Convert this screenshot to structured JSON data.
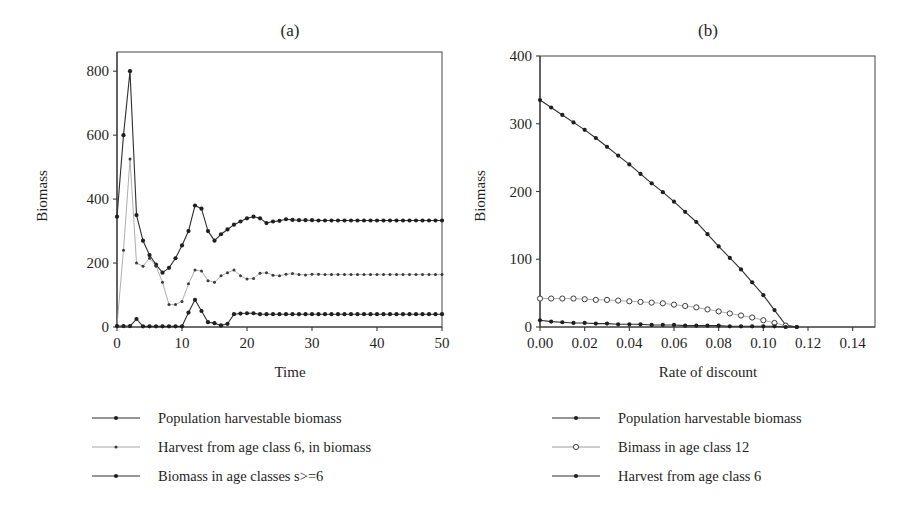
{
  "figure": {
    "panel_a_title": "(a)",
    "panel_b_title": "(b)"
  },
  "chart_data": [
    {
      "type": "line",
      "title": "(a)",
      "xlabel": "Time",
      "ylabel": "Biomass",
      "xlim": [
        0,
        50
      ],
      "ylim": [
        0,
        860
      ],
      "xticks": [
        0,
        10,
        20,
        30,
        40,
        50
      ],
      "xticklabels": [
        "0",
        "10",
        "20",
        "30",
        "40",
        "50"
      ],
      "yticks": [
        0,
        200,
        400,
        600,
        800
      ],
      "yticklabels": [
        "0",
        "200",
        "400",
        "600",
        "800"
      ],
      "grid": false,
      "legend_position": "below",
      "series": [
        {
          "name": "Population harvestable biomass",
          "marker": "filled-circle",
          "color": "#2a2a2a",
          "x": [
            0,
            1,
            2,
            3,
            4,
            5,
            6,
            7,
            8,
            9,
            10,
            11,
            12,
            13,
            14,
            15,
            16,
            17,
            18,
            19,
            20,
            21,
            22,
            23,
            24,
            25,
            26,
            27,
            28,
            29,
            30,
            31,
            32,
            33,
            34,
            35,
            36,
            37,
            38,
            39,
            40,
            41,
            42,
            43,
            44,
            45,
            46,
            47,
            48,
            49,
            50
          ],
          "values": [
            345,
            600,
            800,
            350,
            270,
            225,
            195,
            170,
            185,
            215,
            255,
            300,
            380,
            370,
            300,
            270,
            290,
            305,
            320,
            330,
            340,
            345,
            340,
            325,
            330,
            332,
            337,
            335,
            334,
            334,
            334,
            333,
            333,
            333,
            333,
            333,
            333,
            333,
            333,
            333,
            333,
            333,
            333,
            333,
            333,
            333,
            333,
            333,
            333,
            333,
            333
          ]
        },
        {
          "name": "Harvest from age class 6, in biomass",
          "marker": "small-dot",
          "color": "#8a8a8a",
          "x": [
            0,
            1,
            2,
            3,
            4,
            5,
            6,
            7,
            8,
            9,
            10,
            11,
            12,
            13,
            14,
            15,
            16,
            17,
            18,
            19,
            20,
            21,
            22,
            23,
            24,
            25,
            26,
            27,
            28,
            29,
            30,
            31,
            32,
            33,
            34,
            35,
            36,
            37,
            38,
            39,
            40,
            41,
            42,
            43,
            44,
            45,
            46,
            47,
            48,
            49,
            50
          ],
          "values": [
            5,
            240,
            525,
            200,
            190,
            215,
            190,
            140,
            70,
            70,
            80,
            135,
            178,
            175,
            145,
            140,
            160,
            170,
            178,
            160,
            150,
            152,
            168,
            170,
            162,
            160,
            165,
            167,
            164,
            163,
            165,
            165,
            164,
            164,
            164,
            164,
            164,
            164,
            164,
            164,
            164,
            164,
            164,
            164,
            164,
            164,
            164,
            164,
            164,
            164,
            164
          ]
        },
        {
          "name": "Biomass in age classes s>=6",
          "marker": "filled-circle",
          "color": "#2a2a2a",
          "x": [
            0,
            1,
            2,
            3,
            4,
            5,
            6,
            7,
            8,
            9,
            10,
            11,
            12,
            13,
            14,
            15,
            16,
            17,
            18,
            19,
            20,
            21,
            22,
            23,
            24,
            25,
            26,
            27,
            28,
            29,
            30,
            31,
            32,
            33,
            34,
            35,
            36,
            37,
            38,
            39,
            40,
            41,
            42,
            43,
            44,
            45,
            46,
            47,
            48,
            49,
            50
          ],
          "values": [
            3,
            3,
            3,
            25,
            2,
            2,
            2,
            2,
            2,
            2,
            2,
            45,
            85,
            50,
            15,
            12,
            5,
            10,
            40,
            42,
            43,
            43,
            40,
            40,
            40,
            40,
            40,
            40,
            40,
            40,
            40,
            40,
            40,
            40,
            40,
            40,
            40,
            40,
            40,
            40,
            40,
            40,
            40,
            40,
            40,
            40,
            40,
            40,
            40,
            40,
            40
          ]
        }
      ],
      "legend": [
        {
          "label": "Population harvestable biomass",
          "marker": "filled-circle",
          "color": "#2a2a2a"
        },
        {
          "label": "Harvest from age class 6, in biomass",
          "marker": "small-dot",
          "color": "#8a8a8a"
        },
        {
          "label": "Biomass in age classes s>=6",
          "marker": "filled-circle",
          "color": "#555555"
        }
      ]
    },
    {
      "type": "line",
      "title": "(b)",
      "xlabel": "Rate of discount",
      "ylabel": "Biomass",
      "xlim": [
        0,
        0.15
      ],
      "ylim": [
        0,
        400
      ],
      "xticks": [
        0.0,
        0.02,
        0.04,
        0.06,
        0.08,
        0.1,
        0.12,
        0.14
      ],
      "xticklabels": [
        "0.00",
        "0.02",
        "0.04",
        "0.06",
        "0.08",
        "0.10",
        "0.12",
        "0.14"
      ],
      "yticks": [
        0,
        100,
        200,
        300,
        400
      ],
      "yticklabels": [
        "0",
        "100",
        "200",
        "300",
        "400"
      ],
      "grid": false,
      "legend_position": "below",
      "series": [
        {
          "name": "Population harvestable biomass",
          "marker": "filled-circle",
          "color": "#2a2a2a",
          "x": [
            0.0,
            0.005,
            0.01,
            0.015,
            0.02,
            0.025,
            0.03,
            0.035,
            0.04,
            0.045,
            0.05,
            0.055,
            0.06,
            0.065,
            0.07,
            0.075,
            0.08,
            0.085,
            0.09,
            0.095,
            0.1,
            0.105,
            0.11,
            0.115
          ],
          "values": [
            335,
            324,
            313,
            302,
            291,
            279,
            266,
            253,
            240,
            226,
            212,
            199,
            185,
            170,
            155,
            137,
            119,
            102,
            85,
            66,
            47,
            25,
            3,
            0
          ]
        },
        {
          "name": "Bimass in age class 12",
          "marker": "open-circle",
          "color": "#9a9a9a",
          "x": [
            0.0,
            0.005,
            0.01,
            0.015,
            0.02,
            0.025,
            0.03,
            0.035,
            0.04,
            0.045,
            0.05,
            0.055,
            0.06,
            0.065,
            0.07,
            0.075,
            0.08,
            0.085,
            0.09,
            0.095,
            0.1,
            0.105,
            0.11
          ],
          "values": [
            42,
            42,
            42,
            42,
            41,
            40,
            40,
            39,
            38,
            37,
            36,
            35,
            33,
            31,
            29,
            26,
            23,
            20,
            17,
            14,
            10,
            6,
            2
          ]
        },
        {
          "name": "Harvest from age class 6",
          "marker": "filled-circle",
          "color": "#2a2a2a",
          "x": [
            0.0,
            0.005,
            0.01,
            0.015,
            0.02,
            0.025,
            0.03,
            0.035,
            0.04,
            0.045,
            0.05,
            0.055,
            0.06,
            0.065,
            0.07,
            0.075,
            0.08,
            0.085,
            0.09,
            0.095,
            0.1,
            0.105,
            0.11,
            0.115
          ],
          "values": [
            10,
            8,
            7,
            6,
            6,
            5,
            5,
            4,
            4,
            4,
            3,
            3,
            3,
            2,
            2,
            2,
            2,
            1,
            1,
            1,
            1,
            1,
            0,
            0
          ]
        }
      ],
      "legend": [
        {
          "label": "Population harvestable biomass",
          "marker": "filled-circle",
          "color": "#2a2a2a"
        },
        {
          "label": "Bimass in age class 12",
          "marker": "open-circle",
          "color": "#9a9a9a"
        },
        {
          "label": "Harvest from age class 6",
          "marker": "filled-circle",
          "color": "#2a2a2a"
        }
      ]
    }
  ]
}
